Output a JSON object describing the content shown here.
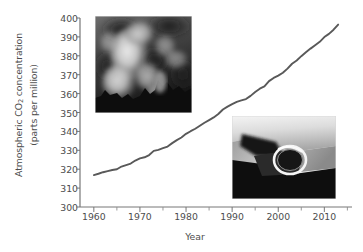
{
  "chart_data": {
    "type": "line",
    "title": "",
    "xlabel": "Year",
    "ylabel": "Atmospheric CO2 concentration (parts per million)",
    "ylabel_line1": "Atmospheric CO",
    "ylabel_sub": "2",
    "ylabel_line1_tail": " concentration",
    "ylabel_line2": "(parts per million)",
    "xlim": [
      1957,
      2016
    ],
    "ylim": [
      300,
      400
    ],
    "grid": false,
    "legend": null,
    "x_ticks": [
      1960,
      1970,
      1980,
      1990,
      2000,
      2010
    ],
    "x_minor_ticks": [
      1965,
      1975,
      1985,
      1995,
      2005,
      2015
    ],
    "y_ticks": [
      300,
      310,
      320,
      330,
      340,
      350,
      360,
      370,
      380,
      390,
      400
    ],
    "line_color": "#595959",
    "series": [
      {
        "name": "Atmospheric CO2 concentration",
        "x": [
          1960,
          1961,
          1962,
          1963,
          1964,
          1965,
          1966,
          1967,
          1968,
          1969,
          1970,
          1971,
          1972,
          1973,
          1974,
          1975,
          1976,
          1977,
          1978,
          1979,
          1980,
          1981,
          1982,
          1983,
          1984,
          1985,
          1986,
          1987,
          1988,
          1989,
          1990,
          1991,
          1992,
          1993,
          1994,
          1995,
          1996,
          1997,
          1998,
          1999,
          2000,
          2001,
          2002,
          2003,
          2004,
          2005,
          2006,
          2007,
          2008,
          2009,
          2010,
          2011,
          2012,
          2013
        ],
        "values": [
          316.9,
          317.6,
          318.4,
          319.0,
          319.6,
          320.0,
          321.4,
          322.2,
          323.0,
          324.6,
          325.7,
          326.3,
          327.5,
          329.7,
          330.2,
          331.1,
          332.0,
          333.8,
          335.4,
          336.8,
          338.7,
          340.1,
          341.4,
          343.0,
          344.6,
          346.0,
          347.4,
          349.2,
          351.6,
          353.1,
          354.4,
          355.6,
          356.4,
          357.1,
          358.8,
          360.8,
          362.6,
          363.8,
          366.6,
          368.3,
          369.5,
          371.0,
          373.2,
          375.8,
          377.5,
          379.8,
          381.9,
          383.8,
          385.6,
          387.4,
          389.9,
          391.6,
          393.8,
          396.5
        ]
      }
    ]
  },
  "insets": [
    {
      "id": "photo-smokestack",
      "name": "smokestack-emissions-photo",
      "description": "Grayscale photograph of smoke plume rising from industrial smokestacks"
    },
    {
      "id": "photo-exhaust",
      "name": "vehicle-exhaust-pipe-photo",
      "description": "Grayscale photograph of a vehicle exhaust tailpipe"
    }
  ]
}
